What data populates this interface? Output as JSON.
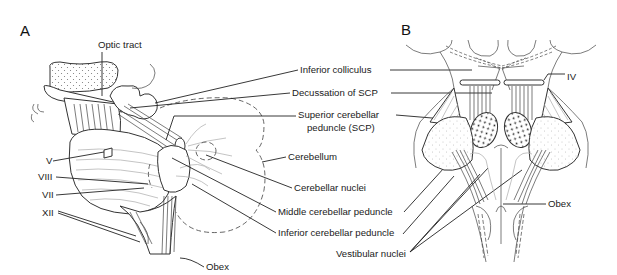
{
  "figure": {
    "panels": [
      {
        "letter": "A",
        "labels": {
          "optic_tract": "Optic tract",
          "v": "V",
          "viii": "VIII",
          "vii": "VII",
          "xii": "XII",
          "obex": "Obex"
        }
      },
      {
        "letter": "B",
        "labels": {
          "iv": "IV",
          "obex": "Obex"
        }
      }
    ],
    "shared_labels": {
      "inferior_colliculus": "Inferior colliculus",
      "decussation_scp": "Decussation of SCP",
      "scp_line1": "Superior cerebellar",
      "scp_line2": "peduncle (SCP)",
      "cerebellum": "Cerebellum",
      "cerebellar_nuclei": "Cerebellar nuclei",
      "middle_cp": "Middle cerebellar peduncle",
      "inferior_cp": "Inferior cerebellar peduncle",
      "vestibular_nuclei": "Vestibular nuclei"
    }
  }
}
